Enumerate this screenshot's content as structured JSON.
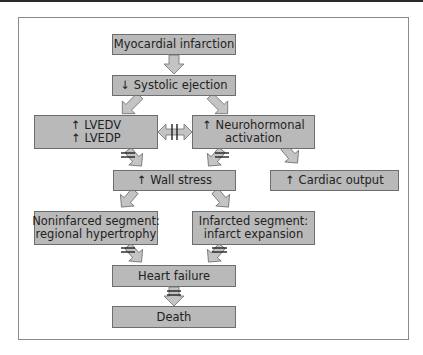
{
  "diagram": {
    "nodes": [
      {
        "id": "mi",
        "lines": [
          "Myocardial infarction"
        ]
      },
      {
        "id": "se",
        "lines": [
          "↓ Systolic ejection"
        ]
      },
      {
        "id": "lv",
        "lines": [
          "↑ LVEDV",
          "↑ LVEDP"
        ]
      },
      {
        "id": "nh",
        "lines": [
          "↑ Neurohormonal",
          "activation"
        ]
      },
      {
        "id": "ws",
        "lines": [
          "↑ Wall stress"
        ]
      },
      {
        "id": "co",
        "lines": [
          "↑ Cardiac output"
        ]
      },
      {
        "id": "ni",
        "lines": [
          "Noninfarced segment:",
          "regional hypertrophy"
        ]
      },
      {
        "id": "is",
        "lines": [
          "Infarcted segment:",
          "infarct expansion"
        ]
      },
      {
        "id": "hf",
        "lines": [
          "Heart failure"
        ]
      },
      {
        "id": "de",
        "lines": [
          "Death"
        ]
      }
    ],
    "edges": [
      {
        "from": "mi",
        "to": "se"
      },
      {
        "from": "se",
        "to": "lv"
      },
      {
        "from": "se",
        "to": "nh"
      },
      {
        "from": "lv",
        "to": "nh",
        "bidirectional": true,
        "interrupted": true
      },
      {
        "from": "lv",
        "to": "ws",
        "interrupted": true
      },
      {
        "from": "nh",
        "to": "ws",
        "interrupted": true
      },
      {
        "from": "nh",
        "to": "co"
      },
      {
        "from": "ws",
        "to": "ni"
      },
      {
        "from": "ws",
        "to": "is"
      },
      {
        "from": "ni",
        "to": "hf",
        "interrupted": true
      },
      {
        "from": "is",
        "to": "hf",
        "interrupted": true
      },
      {
        "from": "hf",
        "to": "de",
        "interrupted": true
      }
    ],
    "colors": {
      "box_fill": "#b9b9b9",
      "box_border": "#6e6e6e",
      "arrow_fill": "#c4c4c4",
      "arrow_stroke": "#6e6e6e"
    }
  }
}
